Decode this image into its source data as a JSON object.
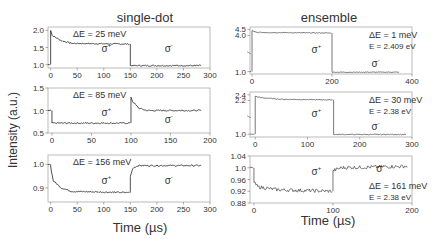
{
  "figure": {
    "left_title": "single-dot",
    "right_title": "ensemble",
    "ylabel": "Intensity (a.u.)",
    "xlabel_left": "Time (µs)",
    "xlabel_right": "Time (µs)"
  },
  "chart_data": [
    {
      "type": "line",
      "group": "single-dot",
      "annotation": "ΔE = 25 meV",
      "labels": [
        "σ+",
        "σ-"
      ],
      "xlim": [
        -5,
        300
      ],
      "ylim": [
        0.9,
        2.1
      ],
      "xticks": [
        0,
        50,
        100,
        150,
        200,
        250,
        300
      ],
      "yticks": [
        1.0,
        1.5,
        2.0
      ],
      "segments": [
        {
          "x": [
            -5,
            0
          ],
          "y": [
            1.0,
            1.0
          ]
        },
        {
          "x": [
            0,
            3,
            20,
            40,
            150
          ],
          "y": [
            2.0,
            1.85,
            1.7,
            1.62,
            1.6
          ]
        },
        {
          "x": [
            150,
            285
          ],
          "y": [
            0.97,
            0.97
          ]
        }
      ]
    },
    {
      "type": "line",
      "group": "single-dot",
      "annotation": "ΔE = 85 meV",
      "labels": [
        "σ+",
        "σ-"
      ],
      "xlim": [
        -5,
        200
      ],
      "ylim": [
        0.5,
        1.5
      ],
      "xticks": [
        0,
        50,
        100,
        150,
        200
      ],
      "yticks": [
        0.5,
        1.0,
        1.5
      ],
      "segments": [
        {
          "x": [
            -5,
            0
          ],
          "y": [
            1.0,
            1.0
          ]
        },
        {
          "x": [
            0,
            100
          ],
          "y": [
            0.72,
            0.72
          ]
        },
        {
          "x": [
            100,
            102,
            110,
            120,
            190
          ],
          "y": [
            1.3,
            1.2,
            1.05,
            1.0,
            1.0
          ]
        }
      ]
    },
    {
      "type": "line",
      "group": "single-dot",
      "annotation": "ΔE = 156 meV",
      "labels": [
        "σ+",
        "σ-"
      ],
      "xlim": [
        -5,
        300
      ],
      "ylim": [
        0.84,
        1.04
      ],
      "xticks": [
        0,
        50,
        100,
        150,
        200,
        250,
        300
      ],
      "yticks": [
        0.9,
        1.0
      ],
      "segments": [
        {
          "x": [
            -5,
            0
          ],
          "y": [
            1.0,
            1.0
          ]
        },
        {
          "x": [
            0,
            5,
            20,
            40,
            150
          ],
          "y": [
            0.99,
            0.93,
            0.9,
            0.885,
            0.88
          ]
        },
        {
          "x": [
            150,
            155,
            165,
            285
          ],
          "y": [
            0.95,
            0.985,
            0.995,
            0.995
          ]
        }
      ]
    },
    {
      "type": "line",
      "group": "ensemble",
      "annotation": "ΔE = 1 meV",
      "annotation2": "E_det = 2.409 eV",
      "labels": [
        "σ+",
        "σ-"
      ],
      "xlim": [
        -5,
        400
      ],
      "ylim": [
        0.8,
        4.7
      ],
      "axis_break": true,
      "xticks": [
        0,
        200,
        400
      ],
      "yticks": [
        1.0,
        4.0,
        4.5
      ],
      "segments": [
        {
          "x": [
            -5,
            0
          ],
          "y": [
            1.0,
            1.0
          ]
        },
        {
          "x": [
            0,
            10,
            200
          ],
          "y": [
            4.4,
            4.25,
            4.2
          ]
        },
        {
          "x": [
            200,
            370
          ],
          "y": [
            0.95,
            0.95
          ]
        }
      ]
    },
    {
      "type": "line",
      "group": "ensemble",
      "annotation": "ΔE = 30  meV",
      "annotation2": "E_det = 2.38 eV",
      "labels": [
        "σ+",
        "σ-"
      ],
      "xlim": [
        -10,
        300
      ],
      "ylim": [
        0.9,
        2.5
      ],
      "axis_break": true,
      "xticks": [
        0,
        100,
        200,
        300
      ],
      "yticks": [
        1.0,
        2.2,
        2.4
      ],
      "segments": [
        {
          "x": [
            -10,
            0
          ],
          "y": [
            1.0,
            1.0
          ]
        },
        {
          "x": [
            0,
            10,
            50,
            150
          ],
          "y": [
            2.35,
            2.3,
            2.24,
            2.22
          ]
        },
        {
          "x": [
            150,
            290
          ],
          "y": [
            0.99,
            0.99
          ]
        }
      ]
    },
    {
      "type": "line",
      "group": "ensemble",
      "annotation": "ΔE = 161 meV",
      "annotation2": "E_det = 2.38 eV",
      "labels": [
        "σ+",
        "σ-"
      ],
      "xlim": [
        -5,
        200
      ],
      "ylim": [
        0.88,
        1.04
      ],
      "xticks": [
        0,
        100,
        200
      ],
      "yticks": [
        0.88,
        0.92,
        0.96,
        1.0,
        1.04
      ],
      "segments": [
        {
          "x": [
            -5,
            0
          ],
          "y": [
            1.0,
            1.0
          ]
        },
        {
          "x": [
            0,
            5,
            30,
            100
          ],
          "y": [
            0.95,
            0.935,
            0.925,
            0.92
          ]
        },
        {
          "x": [
            100,
            110,
            195
          ],
          "y": [
            0.99,
            1.0,
            1.005
          ]
        }
      ]
    }
  ]
}
